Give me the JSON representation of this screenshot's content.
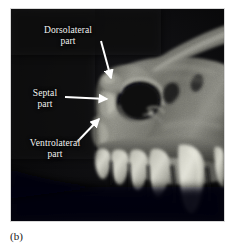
{
  "figure": {
    "caption": "(b)",
    "caption_label": "panel-b",
    "photo_alt": "Lateral view photograph of a mammalian skull showing the nasal aperture region and upper tooth row",
    "background_color": "#ffffff",
    "photo_background_color": "#050505",
    "label_color": "#f4f4f2",
    "arrow_color": "#ffffff"
  },
  "annotations": [
    {
      "name": "dorsolateral-part",
      "line1": "Dorsolateral",
      "line2": "part",
      "arrow": {
        "x1": 90,
        "y1": 32,
        "x2": 101,
        "y2": 70
      }
    },
    {
      "name": "septal-part",
      "line1": "Septal",
      "line2": "part",
      "arrow": {
        "x1": 54,
        "y1": 88,
        "x2": 97,
        "y2": 90
      }
    },
    {
      "name": "ventrolateral-part",
      "line1": "Ventrolateral",
      "line2": "part",
      "arrow": {
        "x1": 66,
        "y1": 133,
        "x2": 88,
        "y2": 109
      }
    }
  ],
  "specimen": {
    "nasal_aperture_label": "nasal-aperture",
    "tooth_row_label": "upper-tooth-row",
    "canine_label": "canine-tooth",
    "rostrum_label": "rostrum",
    "zygomatic_label": "zygomatic-ridge"
  }
}
